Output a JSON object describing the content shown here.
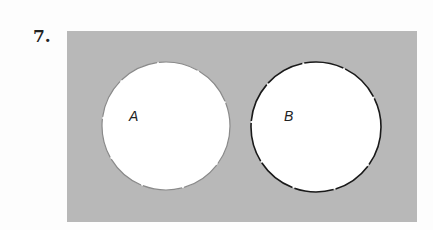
{
  "problem": {
    "number_label": "7.",
    "universe_color": "#b8b8b8",
    "sets": [
      {
        "label": "A",
        "fill": "#ffffff",
        "outline": "#8a8a8a",
        "shaded": false
      },
      {
        "label": "B",
        "fill": "#ffffff",
        "outline": "#1a1a1a",
        "shaded": false
      }
    ],
    "relationship": "disjoint"
  }
}
